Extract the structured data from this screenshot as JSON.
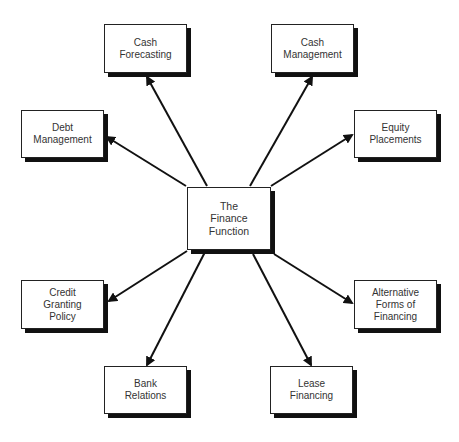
{
  "diagram": {
    "center": {
      "lines": [
        "The",
        "Finance",
        "Function"
      ]
    },
    "nodes": [
      {
        "id": "cash-forecasting",
        "lines": [
          "Cash",
          "Forecasting"
        ]
      },
      {
        "id": "cash-management",
        "lines": [
          "Cash",
          "Management"
        ]
      },
      {
        "id": "debt-management",
        "lines": [
          "Debt",
          "Management"
        ]
      },
      {
        "id": "equity-placements",
        "lines": [
          "Equity",
          "Placements"
        ]
      },
      {
        "id": "credit-granting-policy",
        "lines": [
          "Credit",
          "Granting",
          "Policy"
        ]
      },
      {
        "id": "alternative-forms-of-financing",
        "lines": [
          "Alternative",
          "Forms of",
          "Financing"
        ]
      },
      {
        "id": "bank-relations",
        "lines": [
          "Bank",
          "Relations"
        ]
      },
      {
        "id": "lease-financing",
        "lines": [
          "Lease",
          "Financing"
        ]
      }
    ],
    "edges": [
      {
        "from": "center",
        "to": "cash-forecasting"
      },
      {
        "from": "center",
        "to": "cash-management"
      },
      {
        "from": "center",
        "to": "debt-management"
      },
      {
        "from": "center",
        "to": "equity-placements"
      },
      {
        "from": "center",
        "to": "credit-granting-policy"
      },
      {
        "from": "center",
        "to": "alternative-forms-of-financing"
      },
      {
        "from": "center",
        "to": "bank-relations"
      },
      {
        "from": "center",
        "to": "lease-financing"
      }
    ]
  }
}
